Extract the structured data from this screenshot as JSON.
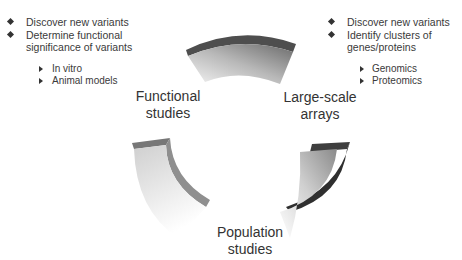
{
  "diagram": {
    "type": "cycle",
    "segments": [
      {
        "label": "Functional studies",
        "lines": [
          "Functional",
          "studies"
        ]
      },
      {
        "label": "Large-scale arrays",
        "lines": [
          "Large-scale",
          "arrays"
        ]
      },
      {
        "label": "Population studies",
        "lines": [
          "Population",
          "studies"
        ]
      }
    ],
    "left_notes": {
      "items": [
        "Discover new variants",
        "Determine functional",
        "significance of variants"
      ],
      "sub_items": [
        "In vitro",
        "Animal models"
      ]
    },
    "right_notes": {
      "items": [
        "Discover new variants",
        "Identify clusters of",
        "genes/proteins"
      ],
      "sub_items": [
        "Genomics",
        "Proteomics"
      ]
    },
    "colors": {
      "segment_dark": "#4a4a4a",
      "segment_mid": "#9a9a9a",
      "segment_light": "#f2f2f2",
      "text": "#333333"
    }
  }
}
